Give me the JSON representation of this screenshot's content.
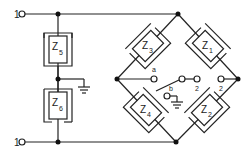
{
  "diagram": {
    "type": "circuit",
    "terminals": {
      "input_top": "1",
      "input_bottom": "1",
      "switch_a": "a",
      "switch_b": "b",
      "output_left": "2",
      "output_right": "2"
    },
    "impedances": [
      {
        "id": "z5",
        "label": "Z",
        "sub": "5"
      },
      {
        "id": "z6",
        "label": "Z",
        "sub": "6"
      },
      {
        "id": "z3",
        "label": "Z",
        "sub": "3"
      },
      {
        "id": "z1",
        "label": "Z",
        "sub": "1"
      },
      {
        "id": "z4",
        "label": "Z",
        "sub": "4"
      },
      {
        "id": "z2",
        "label": "Z",
        "sub": "2"
      }
    ],
    "colors": {
      "line": "#222222",
      "background": "#ffffff"
    }
  }
}
